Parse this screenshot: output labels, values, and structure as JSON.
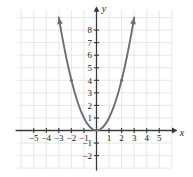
{
  "figure": {
    "name": "parabola-graph",
    "axis_labels": {
      "x": "x",
      "y": "y"
    },
    "colors": {
      "curve": "#6e6e6e",
      "axis": "#3a3a3a",
      "grid": "#dcdcdc",
      "background": "#ffffff",
      "label": "#1a1a1a"
    }
  },
  "chart_data": {
    "type": "line",
    "title": "",
    "subtitle": "",
    "xlabel": "x",
    "ylabel": "y",
    "xlim": [
      -5.5,
      5.5
    ],
    "ylim": [
      -2.8,
      8.8
    ],
    "grid": true,
    "legend": "none",
    "x_ticks": [
      -5,
      -4,
      -3,
      -2,
      -1,
      1,
      2,
      3,
      4,
      5
    ],
    "x_tick_labels": [
      "−5",
      "−4",
      "−3",
      "−2",
      "−1",
      "1",
      "2",
      "3",
      "4",
      "5"
    ],
    "y_ticks": [
      -2,
      -1,
      1,
      2,
      3,
      4,
      5,
      6,
      7,
      8
    ],
    "y_tick_labels": [
      "−2",
      "−1",
      "1",
      "2",
      "3",
      "4",
      "5",
      "6",
      "7",
      "8"
    ],
    "series": [
      {
        "name": "y = x²",
        "equation": "y = x^2",
        "vertex": [
          0,
          0
        ],
        "arrows": "both",
        "x": [
          -3.0,
          -2.75,
          -2.5,
          -2.25,
          -2.0,
          -1.75,
          -1.5,
          -1.25,
          -1.0,
          -0.75,
          -0.5,
          -0.25,
          0,
          0.25,
          0.5,
          0.75,
          1.0,
          1.25,
          1.5,
          1.75,
          2.0,
          2.25,
          2.5,
          2.75,
          3.0
        ],
        "values": [
          9.0,
          7.5625,
          6.25,
          5.0625,
          4.0,
          3.0625,
          2.25,
          1.5625,
          1.0,
          0.5625,
          0.25,
          0.0625,
          0,
          0.0625,
          0.25,
          0.5625,
          1.0,
          1.5625,
          2.25,
          3.0625,
          4.0,
          5.0625,
          6.25,
          7.5625,
          9.0
        ]
      }
    ],
    "markers": [
      {
        "x": -2,
        "y": 4
      },
      {
        "x": 2,
        "y": 4
      }
    ]
  }
}
